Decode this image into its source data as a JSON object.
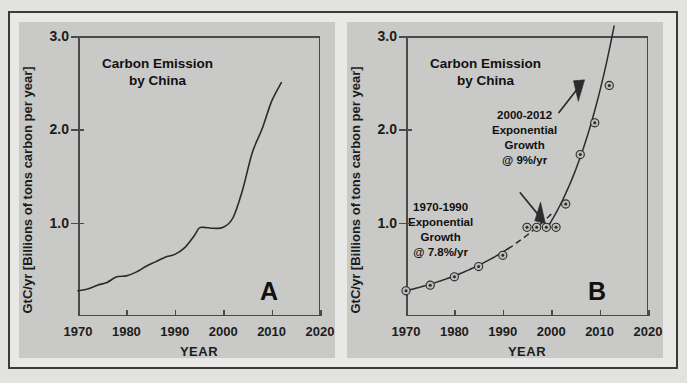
{
  "figure": {
    "background_color": "#e2e2e0",
    "panel_color": "#c9c9c7",
    "axis_color": "#4a4a4a",
    "curve_color": "#2b2b2b"
  },
  "panel_a": {
    "letter": "A",
    "title_line1": "Carbon Emission",
    "title_line2": "by China"
  },
  "panel_b": {
    "letter": "B",
    "title_line1": "Carbon Emission",
    "title_line2": "by China",
    "annotation_late_line1": "2000-2012",
    "annotation_late_line2": "Exponential",
    "annotation_late_line3": "Growth",
    "annotation_late_line4": "@ 9%/yr",
    "annotation_early_line1": "1970-1990",
    "annotation_early_line2": "Exponential",
    "annotation_early_line3": "Growth",
    "annotation_early_line4": "@ 7.8%/yr"
  },
  "chart_data": [
    {
      "type": "line",
      "panel": "A",
      "title": "Carbon Emission by China",
      "xlabel": "YEAR",
      "ylabel": "GtC/yr  [Billions of tons carbon per year]",
      "xlim": [
        1970,
        2020
      ],
      "ylim": [
        0,
        3.0
      ],
      "xticks": [
        1970,
        1980,
        1990,
        2000,
        2010,
        2020
      ],
      "yticks": [
        1.0,
        2.0,
        3.0
      ],
      "grid": false,
      "legend": "none",
      "series": [
        {
          "name": "China carbon emission",
          "style": "solid-line",
          "x": [
            1970,
            1972,
            1974,
            1976,
            1978,
            1980,
            1982,
            1984,
            1986,
            1988,
            1990,
            1992,
            1994,
            1995,
            1996,
            1998,
            2000,
            2002,
            2004,
            2006,
            2008,
            2010,
            2012
          ],
          "values": [
            0.27,
            0.29,
            0.33,
            0.36,
            0.42,
            0.43,
            0.47,
            0.53,
            0.58,
            0.63,
            0.66,
            0.73,
            0.86,
            0.94,
            0.95,
            0.94,
            0.95,
            1.05,
            1.35,
            1.75,
            2.0,
            2.3,
            2.5
          ]
        }
      ]
    },
    {
      "type": "scatter",
      "panel": "B",
      "title": "Carbon Emission by China",
      "xlabel": "YEAR",
      "ylabel": "GtC/yr  [Billions of tons carbon per year]",
      "xlim": [
        1970,
        2020
      ],
      "ylim": [
        0,
        3.0
      ],
      "xticks": [
        1970,
        1980,
        1990,
        2000,
        2010,
        2020
      ],
      "yticks": [
        1.0,
        2.0,
        3.0
      ],
      "grid": false,
      "legend": "none",
      "series": [
        {
          "name": "Observed emission points",
          "style": "circle-markers",
          "x": [
            1970,
            1975,
            1980,
            1985,
            1990,
            1995,
            1997,
            1999,
            2001,
            2003,
            2006,
            2009,
            2012
          ],
          "values": [
            0.27,
            0.33,
            0.42,
            0.53,
            0.65,
            0.95,
            0.95,
            0.95,
            0.95,
            1.2,
            1.73,
            2.07,
            2.47
          ]
        },
        {
          "name": "1970-1990 exponential fit @ 7.8%/yr",
          "style": "solid-then-dashed-curve",
          "growth_rate_pct_per_yr": 7.8,
          "period": "1970-1990"
        },
        {
          "name": "2000-2012 exponential fit @ 9%/yr",
          "style": "solid-curve",
          "growth_rate_pct_per_yr": 9.0,
          "period": "2000-2012"
        }
      ],
      "annotations": [
        {
          "text": "2000-2012 Exponential Growth @ 9%/yr",
          "arrow_to_x": 2008,
          "arrow_to_y": 2.45
        },
        {
          "text": "1970-1990 Exponential Growth @ 7.8%/yr",
          "arrow_to_x": 2000,
          "arrow_to_y": 1.0
        }
      ]
    }
  ]
}
